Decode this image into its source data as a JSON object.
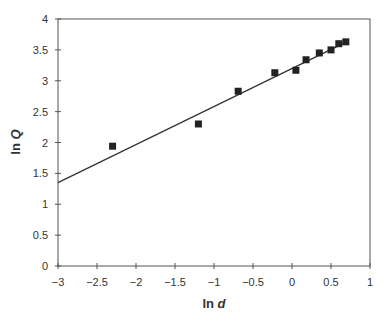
{
  "chart_data": {
    "type": "scatter",
    "title": "",
    "xlabel": "ln d",
    "ylabel": "ln Q",
    "xlim": [
      -3,
      1
    ],
    "ylim": [
      0,
      4
    ],
    "xticks": [
      -3,
      -2.5,
      -2,
      -1.5,
      -1,
      -0.5,
      0,
      0.5,
      1
    ],
    "xtick_labels": [
      "−3",
      "−2.5",
      "−2",
      "−1.5",
      "−1",
      "−0.5",
      "0",
      "0.5",
      "1"
    ],
    "yticks": [
      0,
      0.5,
      1,
      1.5,
      2,
      2.5,
      3,
      3.5,
      4
    ],
    "ytick_labels": [
      "0",
      "0.5",
      "1",
      "1.5",
      "2",
      "2.5",
      "3",
      "3.5",
      "4"
    ],
    "grid": false,
    "legend": "none",
    "series": [
      {
        "name": "data",
        "marker": "square",
        "color": "#222222",
        "x": [
          -2.3,
          -1.2,
          -0.69,
          -0.22,
          0.05,
          0.18,
          0.35,
          0.5,
          0.6,
          0.69
        ],
        "y": [
          1.94,
          2.3,
          2.83,
          3.13,
          3.17,
          3.34,
          3.45,
          3.5,
          3.6,
          3.63
        ]
      }
    ],
    "fit_line": {
      "name": "linear fit",
      "color": "#333333",
      "x": [
        -3,
        0.7
      ],
      "y": [
        1.35,
        3.63
      ]
    }
  },
  "colors": {
    "axis": "#555555",
    "marker": "#222222",
    "line": "#333333",
    "text": "#333333"
  }
}
